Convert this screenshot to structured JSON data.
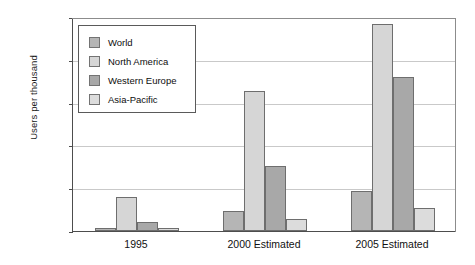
{
  "chart_data": {
    "type": "bar",
    "title": "",
    "xlabel": "",
    "ylabel": "Users per thousand",
    "categories": [
      "1995",
      "2000 Estimated",
      "2005 Estimated"
    ],
    "series": [
      {
        "name": "World",
        "color": "#b5b5b5",
        "values": [
          10,
          70,
          140
        ]
      },
      {
        "name": "North America",
        "color": "#d6d6d6",
        "values": [
          120,
          490,
          725
        ]
      },
      {
        "name": "Western Europe",
        "color": "#a8a8a8",
        "values": [
          30,
          228,
          540
        ]
      },
      {
        "name": "Asia-Pacific",
        "color": "#dcdcdc",
        "values": [
          12,
          42,
          80
        ]
      }
    ],
    "ylim": [
      0,
      750
    ],
    "yticks": [
      0,
      150,
      300,
      450,
      600,
      750
    ],
    "ytick_labels": [
      "0",
      "150",
      "300",
      "450",
      "600",
      "750"
    ],
    "grid": true,
    "legend_position": "top-left",
    "bar_border_color": "#6e6e6e",
    "axis_color": "#4d4d4d",
    "gridline_color": "#c9c9c9"
  }
}
